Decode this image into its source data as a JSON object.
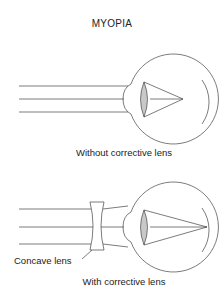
{
  "title": "MYOPIA",
  "panels": [
    {
      "caption": "Without corrective lens"
    },
    {
      "caption": "With corrective lens",
      "lens_label": "Concave lens"
    }
  ],
  "colors": {
    "stroke": "#444444",
    "lens_fill": "#c8c8c8",
    "background": "#ffffff"
  }
}
